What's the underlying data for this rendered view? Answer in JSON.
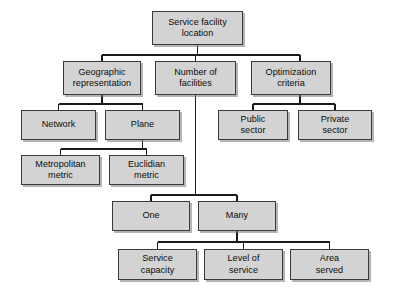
{
  "diagram": {
    "type": "hierarchy-tree",
    "title": "Service facility location",
    "background_color": "#ffffff",
    "node_fill_color": "#d3d3d3",
    "node_border_color": "#3a3a3a",
    "connector_color": "#1a1a1a",
    "nodes": [
      {
        "id": "root",
        "label": "Service facility\nlocation",
        "level": 0,
        "x": 152,
        "y": 11,
        "w": 91,
        "h": 34
      },
      {
        "id": "geographic",
        "label": "Geographic\nrepresentation",
        "level": 1,
        "x": 63,
        "y": 61,
        "w": 78,
        "h": 34
      },
      {
        "id": "number",
        "label": "Number of\nfacilities",
        "level": 1,
        "x": 155,
        "y": 61,
        "w": 81,
        "h": 34
      },
      {
        "id": "optimization",
        "label": "Optimization\ncriteria",
        "level": 1,
        "x": 251,
        "y": 61,
        "w": 80,
        "h": 34
      },
      {
        "id": "network",
        "label": "Network",
        "level": 2,
        "x": 21,
        "y": 110,
        "w": 75,
        "h": 30
      },
      {
        "id": "plane",
        "label": "Plane",
        "level": 2,
        "x": 105,
        "y": 110,
        "w": 75,
        "h": 30
      },
      {
        "id": "public-sector",
        "label": "Public\nsector",
        "level": 2,
        "x": 218,
        "y": 110,
        "w": 70,
        "h": 30
      },
      {
        "id": "private-sector",
        "label": "Private\nsector",
        "level": 2,
        "x": 298,
        "y": 110,
        "w": 74,
        "h": 30
      },
      {
        "id": "metropolitan",
        "label": "Metropolitan\nmetric",
        "level": 3,
        "x": 21,
        "y": 155,
        "w": 79,
        "h": 30
      },
      {
        "id": "euclidian",
        "label": "Euclidian\nmetric",
        "level": 3,
        "x": 109,
        "y": 155,
        "w": 75,
        "h": 30
      },
      {
        "id": "one",
        "label": "One",
        "level": 4,
        "x": 112,
        "y": 201,
        "w": 78,
        "h": 30
      },
      {
        "id": "many",
        "label": "Many",
        "level": 4,
        "x": 198,
        "y": 201,
        "w": 78,
        "h": 30
      },
      {
        "id": "service-capacity",
        "label": "Service\ncapacity",
        "level": 5,
        "x": 118,
        "y": 249,
        "w": 79,
        "h": 31
      },
      {
        "id": "level-of-service",
        "label": "Level of\nservice",
        "level": 5,
        "x": 204,
        "y": 249,
        "w": 79,
        "h": 31
      },
      {
        "id": "area-served",
        "label": "Area\nserved",
        "level": 5,
        "x": 290,
        "y": 249,
        "w": 79,
        "h": 31
      }
    ],
    "edges": [
      {
        "from": "root",
        "to": "geographic"
      },
      {
        "from": "root",
        "to": "number"
      },
      {
        "from": "root",
        "to": "optimization"
      },
      {
        "from": "geographic",
        "to": "network"
      },
      {
        "from": "geographic",
        "to": "plane"
      },
      {
        "from": "optimization",
        "to": "public-sector"
      },
      {
        "from": "optimization",
        "to": "private-sector"
      },
      {
        "from": "plane",
        "to": "metropolitan"
      },
      {
        "from": "plane",
        "to": "euclidian"
      },
      {
        "from": "number",
        "to": "one"
      },
      {
        "from": "number",
        "to": "many"
      },
      {
        "from": "many",
        "to": "service-capacity"
      },
      {
        "from": "many",
        "to": "level-of-service"
      },
      {
        "from": "many",
        "to": "area-served"
      }
    ]
  }
}
